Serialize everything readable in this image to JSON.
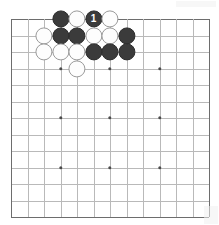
{
  "diagram": {
    "board": {
      "type": "go-board",
      "visible_columns": 13,
      "visible_rows": 13,
      "origin_x": 11,
      "origin_y": 19,
      "cell_size": 16.5,
      "line_color": "#b9b9b9",
      "edge_color": "#6d6d6d",
      "background_color": "#ffffff",
      "star_point_color": "#4a4a4a",
      "star_columns": [
        4,
        7,
        10
      ],
      "star_rows": [
        4,
        7,
        10
      ]
    },
    "stone_colors": {
      "black_fill": "#3b3b3b",
      "black_label": "#ffffff",
      "white_fill": "#fdfdfd",
      "white_edge": "#9a9a9a"
    },
    "stone_radius": 8.6,
    "stones": [
      {
        "col": 4,
        "row": 1,
        "color": "black",
        "label": ""
      },
      {
        "col": 5,
        "row": 1,
        "color": "white",
        "label": ""
      },
      {
        "col": 6,
        "row": 1,
        "color": "black",
        "label": "1"
      },
      {
        "col": 7,
        "row": 1,
        "color": "white",
        "label": ""
      },
      {
        "col": 3,
        "row": 2,
        "color": "white",
        "label": ""
      },
      {
        "col": 4,
        "row": 2,
        "color": "black",
        "label": ""
      },
      {
        "col": 5,
        "row": 2,
        "color": "black",
        "label": ""
      },
      {
        "col": 6,
        "row": 2,
        "color": "white",
        "label": ""
      },
      {
        "col": 7,
        "row": 2,
        "color": "white",
        "label": ""
      },
      {
        "col": 8,
        "row": 2,
        "color": "black",
        "label": ""
      },
      {
        "col": 3,
        "row": 3,
        "color": "white",
        "label": ""
      },
      {
        "col": 4,
        "row": 3,
        "color": "white",
        "label": ""
      },
      {
        "col": 5,
        "row": 3,
        "color": "white",
        "label": ""
      },
      {
        "col": 6,
        "row": 3,
        "color": "black",
        "label": ""
      },
      {
        "col": 7,
        "row": 3,
        "color": "black",
        "label": ""
      },
      {
        "col": 8,
        "row": 3,
        "color": "black",
        "label": ""
      },
      {
        "col": 5,
        "row": 4,
        "color": "white",
        "label": ""
      }
    ],
    "move_numbers": [
      {
        "number": "1",
        "color": "black",
        "col": 6,
        "row": 1
      }
    ]
  }
}
